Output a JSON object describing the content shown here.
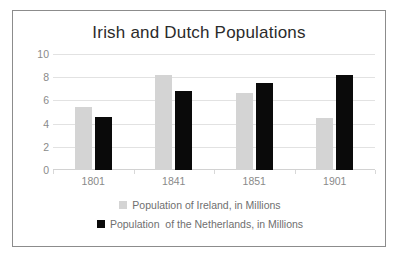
{
  "chart_data": {
    "type": "bar",
    "title": "Irish and Dutch Populations",
    "xlabel": "",
    "ylabel": "",
    "categories": [
      "1801",
      "1841",
      "1851",
      "1901"
    ],
    "series": [
      {
        "name": "Population of Ireland, in Millions",
        "color": "#d4d4d4",
        "values": [
          5.4,
          8.2,
          6.6,
          4.5
        ]
      },
      {
        "name": "Population  of the Netherlands, in Millions",
        "color": "#0a0a0a",
        "values": [
          4.6,
          6.8,
          7.5,
          8.2
        ]
      }
    ],
    "ylim": [
      0,
      10
    ],
    "yticks": [
      "0",
      "2",
      "4",
      "6",
      "8",
      "10"
    ],
    "ytick_values": [
      0,
      2,
      4,
      6,
      8,
      10
    ],
    "grid": true,
    "legend_position": "bottom"
  },
  "legend": {
    "entries": [
      {
        "label": "Population of Ireland, in Millions",
        "swatch": "legend-swatch-gray"
      },
      {
        "label": "Population  of the Netherlands, in Millions",
        "swatch": "legend-swatch-black"
      }
    ]
  },
  "colors": {
    "ireland": "#d4d4d4",
    "netherlands": "#0a0a0a",
    "gridline": "#e2e2e2",
    "border": "#8c8c8c",
    "tick_text": "#8a8a8a",
    "title_text": "#2b2b2b",
    "legend_text": "#6f6f6f",
    "background": "#ffffff"
  }
}
